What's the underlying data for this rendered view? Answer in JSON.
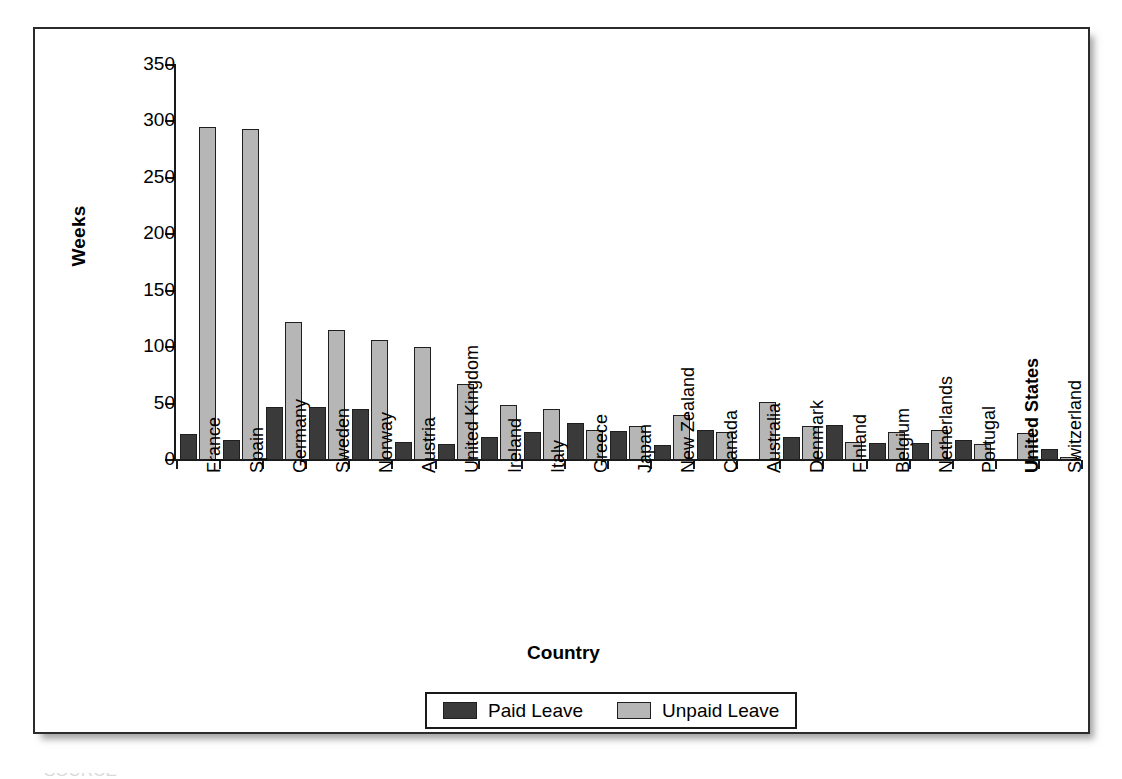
{
  "chart_data": {
    "type": "bar",
    "title": "",
    "xlabel": "Country",
    "ylabel": "Weeks",
    "ylim": [
      0,
      350
    ],
    "yticks": [
      0,
      50,
      100,
      150,
      200,
      250,
      300,
      350
    ],
    "grid": false,
    "legend_position": "bottom-center",
    "emphasized_categories": [
      "United States"
    ],
    "categories": [
      "France",
      "Spain",
      "Germany",
      "Sweden",
      "Norway",
      "Austria",
      "United Kingdom",
      "Ireland",
      "Italy",
      "Greece",
      "Japan",
      "New Zealand",
      "Canada",
      "Australia",
      "Denmark",
      "Finland",
      "Belgium",
      "Netherlands",
      "Portugal",
      "United States",
      "Switzerland"
    ],
    "series": [
      {
        "name": "Paid Leave",
        "color": "#3a3a3a",
        "values": [
          23,
          18,
          47,
          47,
          45,
          16,
          14,
          20,
          25,
          33,
          26,
          13,
          27,
          null,
          20,
          31,
          15,
          15,
          18,
          null,
          10
        ]
      },
      {
        "name": "Unpaid Leave",
        "color": "#b6b6b6",
        "values": [
          295,
          293,
          122,
          115,
          106,
          100,
          67,
          49,
          45,
          27,
          30,
          40,
          25,
          51,
          30,
          16,
          25,
          27,
          14,
          24,
          3
        ]
      }
    ]
  },
  "axis": {
    "y_title": "Weeks",
    "x_title": "Country",
    "tick_labels": [
      "350",
      "300",
      "250",
      "200",
      "150",
      "100",
      "50",
      "0"
    ]
  },
  "legend": {
    "items": [
      {
        "label": "Paid Leave",
        "swatch": "paid"
      },
      {
        "label": "Unpaid Leave",
        "swatch": "unpaid"
      }
    ]
  },
  "caption": {
    "text": "SOURCE"
  }
}
